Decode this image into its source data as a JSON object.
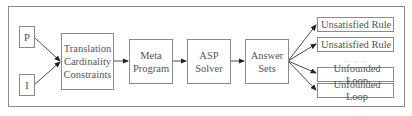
{
  "diagram": {
    "inputs": [
      {
        "label": "P"
      },
      {
        "label": "I"
      }
    ],
    "translation": {
      "lines": [
        "Translation",
        "Cardinality",
        "Constraints"
      ]
    },
    "meta_program": {
      "lines": [
        "Meta",
        "Program"
      ]
    },
    "asp_solver": {
      "lines": [
        "ASP",
        "Solver"
      ]
    },
    "answer_sets": {
      "lines": [
        "Answer",
        "Sets"
      ]
    },
    "outputs": [
      {
        "label": "Unsatisfied Rule"
      },
      {
        "label": "Unsatisfied Rule"
      },
      {
        "label": "Unfounded Loop"
      },
      {
        "label": "Unfounded Loop"
      }
    ],
    "ellipsis": "· · ·",
    "colors": {
      "stroke": "#8a8a8a",
      "arrow": "#222222",
      "text": "#555555"
    }
  }
}
